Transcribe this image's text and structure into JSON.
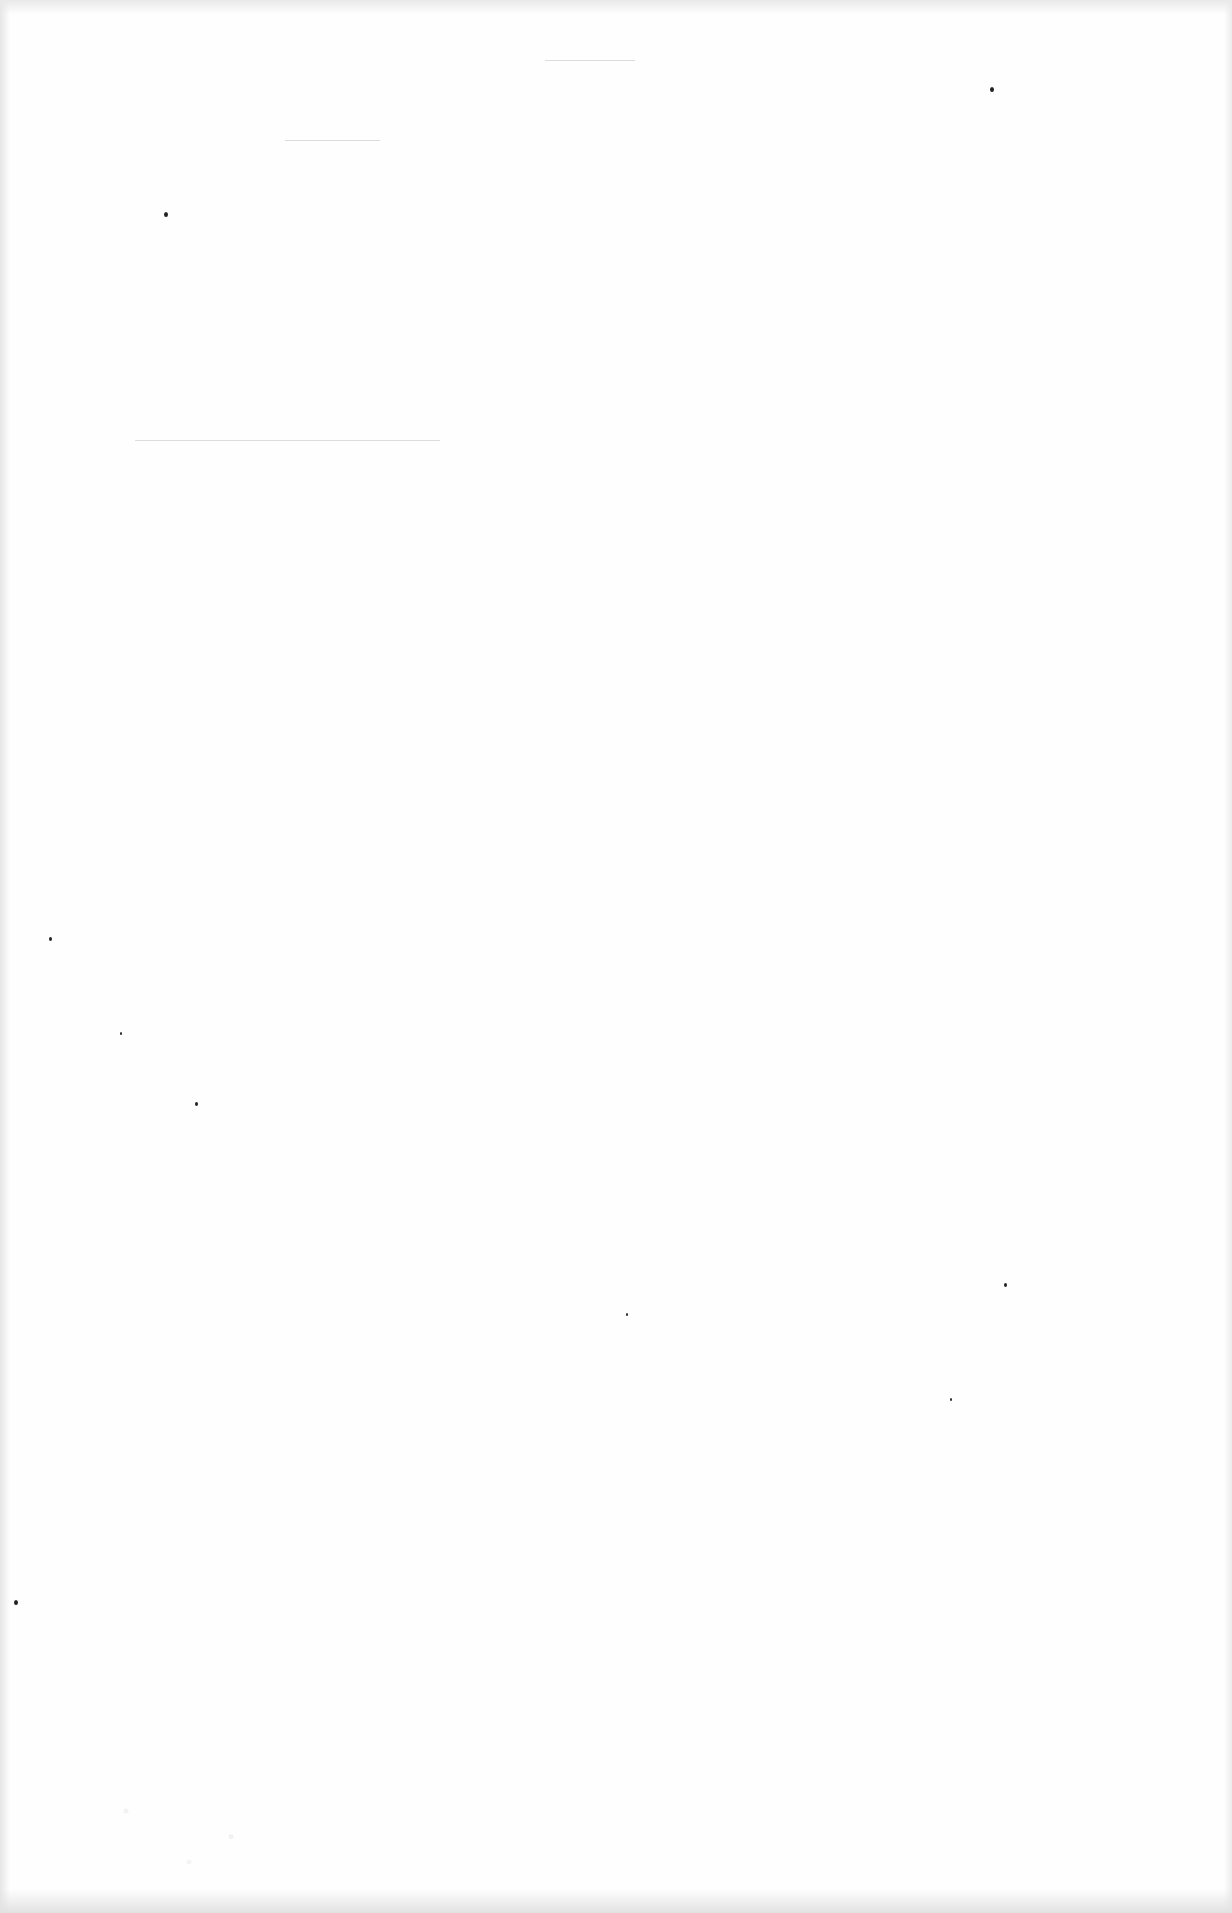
{
  "page": {
    "type": "blank-scanned-page",
    "background_color": "#fefefe",
    "edge_shade_color": "#e6e6e6",
    "text_blocks": [],
    "rules": [
      {
        "x": 545,
        "y": 60,
        "width": 90
      },
      {
        "x": 285,
        "y": 140,
        "width": 95
      },
      {
        "x": 135,
        "y": 440,
        "width": 305
      }
    ],
    "specks": [
      {
        "x": 164,
        "y": 212,
        "size": 4
      },
      {
        "x": 990,
        "y": 87,
        "size": 4
      },
      {
        "x": 14,
        "y": 1600,
        "size": 4
      },
      {
        "x": 626,
        "y": 1313,
        "size": 2
      },
      {
        "x": 1004,
        "y": 1283,
        "size": 3
      },
      {
        "x": 950,
        "y": 1398,
        "size": 2
      },
      {
        "x": 49,
        "y": 937,
        "size": 3
      },
      {
        "x": 120,
        "y": 1032,
        "size": 2
      },
      {
        "x": 195,
        "y": 1102,
        "size": 3
      }
    ]
  }
}
